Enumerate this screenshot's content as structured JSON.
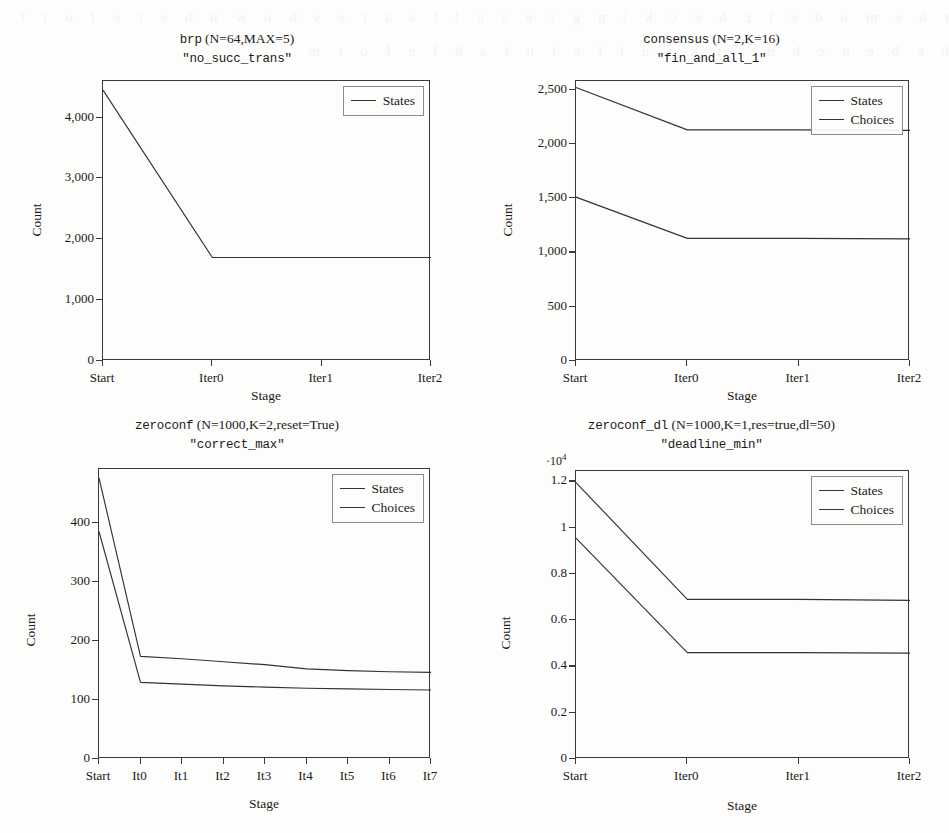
{
  "figure": {
    "background": "#fdfdfc",
    "line_color": "#333333",
    "axis_color": "#3a3a3a"
  },
  "bleed_text": "t h e   m o d e l   c h e c k i n g   r e s u l t s   a r e   s h o w n   h e r e   f o r   t h e   b e n c h m a r k   s u i t e   i n   t a b l e   f o r m",
  "chart_data": [
    {
      "id": "brp",
      "type": "line",
      "title": "brp (N=64,MAX=5)",
      "title_mono": "brp",
      "title_rest": " (N=64,MAX=5)",
      "subtitle": "\"no_succ_trans\"",
      "xlabel": "Stage",
      "ylabel": "Count",
      "grid": false,
      "legend_position": "top-right",
      "categories": [
        "Start",
        "Iter0",
        "Iter1",
        "Iter2"
      ],
      "yticks": [
        0,
        1000,
        2000,
        3000,
        4000
      ],
      "ytick_labels": [
        "0",
        "1,000",
        "2,000",
        "3,000",
        "4,000"
      ],
      "ylim": [
        0,
        4600
      ],
      "exp_label": "",
      "series": [
        {
          "name": "States",
          "values": [
            4450,
            1700,
            1700,
            1700
          ]
        }
      ]
    },
    {
      "id": "consensus",
      "type": "line",
      "title": "consensus (N=2,K=16)",
      "title_mono": "consensus",
      "title_rest": " (N=2,K=16)",
      "subtitle": "\"fin_and_all_1\"",
      "xlabel": "Stage",
      "ylabel": "Count",
      "grid": false,
      "legend_position": "top-right",
      "categories": [
        "Start",
        "Iter0",
        "Iter1",
        "Iter2"
      ],
      "yticks": [
        0,
        500,
        1000,
        1500,
        2000,
        2500
      ],
      "ytick_labels": [
        "0",
        "500",
        "1,000",
        "1,500",
        "2,000",
        "2,500"
      ],
      "ylim": [
        0,
        2580
      ],
      "exp_label": "",
      "series": [
        {
          "name": "States",
          "values": [
            1510,
            1130,
            1130,
            1125
          ]
        },
        {
          "name": "Choices",
          "values": [
            2520,
            2130,
            2130,
            2125
          ]
        }
      ]
    },
    {
      "id": "zeroconf",
      "type": "line",
      "title": "zeroconf (N=1000,K=2,reset=True)",
      "title_mono": "zeroconf",
      "title_rest": " (N=1000,K=2,reset=True)",
      "subtitle": "\"correct_max\"",
      "xlabel": "Stage",
      "ylabel": "Count",
      "grid": false,
      "legend_position": "top-right",
      "categories": [
        "Start",
        "It0",
        "It1",
        "It2",
        "It3",
        "It4",
        "It5",
        "It6",
        "It7"
      ],
      "yticks": [
        0,
        100,
        200,
        300,
        400
      ],
      "ytick_labels": [
        "0",
        "100",
        "200",
        "300",
        "400"
      ],
      "ylim": [
        0,
        492
      ],
      "exp_label": "",
      "series": [
        {
          "name": "States",
          "values": [
            386,
            130,
            127,
            124,
            122,
            120,
            119,
            118,
            117
          ]
        },
        {
          "name": "Choices",
          "values": [
            477,
            174,
            170,
            165,
            160,
            153,
            150,
            148,
            147
          ]
        }
      ]
    },
    {
      "id": "zeroconf_dl",
      "type": "line",
      "title": "zeroconf_dl (N=1000,K=1,res=true,dl=50)",
      "title_mono": "zeroconf_dl",
      "title_rest": " (N=1000,K=1,res=true,dl=50)",
      "subtitle": "\"deadline_min\"",
      "xlabel": "Stage",
      "ylabel": "Count",
      "grid": false,
      "legend_position": "top-right",
      "categories": [
        "Start",
        "Iter0",
        "Iter1",
        "Iter2"
      ],
      "yticks": [
        0,
        0.2,
        0.4,
        0.6,
        0.8,
        1,
        1.2
      ],
      "ytick_labels": [
        "0",
        "0.2",
        "0.4",
        "0.6",
        "0.8",
        "1",
        "1.2"
      ],
      "ylim": [
        0,
        1.245
      ],
      "exp_label": "·10",
      "exp_sup": "4",
      "series": [
        {
          "name": "States",
          "values": [
            0.955,
            0.46,
            0.46,
            0.458
          ]
        },
        {
          "name": "Choices",
          "values": [
            1.195,
            0.69,
            0.69,
            0.686
          ]
        }
      ]
    }
  ]
}
